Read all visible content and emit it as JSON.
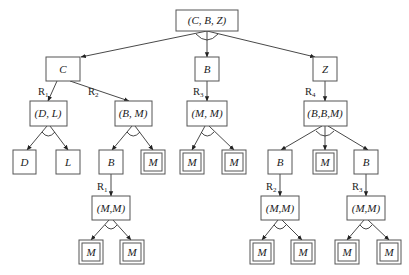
{
  "diagram": {
    "type": "AND-OR decomposition tree",
    "nodes": {
      "root": {
        "label": "(C, B, Z)"
      },
      "c": {
        "label": "C"
      },
      "b_mid": {
        "label": "B"
      },
      "z": {
        "label": "Z"
      },
      "dl": {
        "label": "(D, L)"
      },
      "bm": {
        "label": "(B, M)"
      },
      "mm_mid": {
        "label": "(M, M)"
      },
      "bbm": {
        "label": "(B,B,M)"
      },
      "d": {
        "label": "D"
      },
      "l": {
        "label": "L"
      },
      "b_left": {
        "label": "B"
      },
      "m_left_term": {
        "label": "M"
      },
      "m_mid_1": {
        "label": "M"
      },
      "m_mid_2": {
        "label": "M"
      },
      "b_right_1": {
        "label": "B"
      },
      "m_right_term": {
        "label": "M"
      },
      "b_right_2": {
        "label": "B"
      },
      "mm_left": {
        "label": "(M,M)"
      },
      "mm_right_1": {
        "label": "(M,M)"
      },
      "mm_right_2": {
        "label": "(M,M)"
      },
      "m_bl_1": {
        "label": "M"
      },
      "m_bl_2": {
        "label": "M"
      },
      "m_br1_1": {
        "label": "M"
      },
      "m_br1_2": {
        "label": "M"
      },
      "m_br2_1": {
        "label": "M"
      },
      "m_br2_2": {
        "label": "M"
      }
    },
    "rules": {
      "c_to_dl": {
        "main": "R",
        "sub": "1"
      },
      "c_to_bm": {
        "main": "R",
        "sub": "2"
      },
      "b_to_mm": {
        "main": "R",
        "sub": "3"
      },
      "z_to_bbm": {
        "main": "R",
        "sub": "4"
      },
      "bleft_to_mm": {
        "main": "R",
        "sub": "1"
      },
      "bright1_to_mm": {
        "main": "R",
        "sub": "2"
      },
      "bright2_to_mm": {
        "main": "R",
        "sub": "3"
      }
    }
  }
}
